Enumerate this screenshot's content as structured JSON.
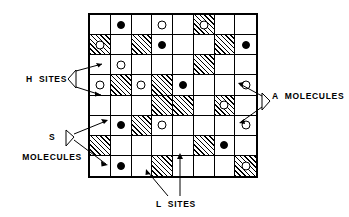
{
  "figure": {
    "type": "lattice-site-diagram",
    "grid": {
      "rows": 8,
      "cols": 8
    },
    "legend_keys": {
      "h_site": "plain (unhatched) square = H site",
      "l_site": "hatched square = L site",
      "a_molecule": "open circle = A molecule",
      "s_molecule": "filled circle = S molecule"
    }
  },
  "labels": {
    "h_sites": "H  SITES",
    "s_molecules_line1": "S",
    "s_molecules_line2": "MOLECULES",
    "a_molecules": "A  MOLECULES",
    "l_sites": "L  SITES"
  },
  "colors": {
    "ink": "#000000",
    "paper": "#ffffff"
  },
  "lattice": {
    "rows": [
      [
        {
          "site": "H",
          "molecule": null
        },
        {
          "site": "H",
          "molecule": "S"
        },
        {
          "site": "H",
          "molecule": null
        },
        {
          "site": "H",
          "molecule": "A"
        },
        {
          "site": "H",
          "molecule": null
        },
        {
          "site": "L",
          "molecule": "A"
        },
        {
          "site": "H",
          "molecule": null
        },
        {
          "site": "H",
          "molecule": null
        }
      ],
      [
        {
          "site": "L",
          "molecule": "A"
        },
        {
          "site": "H",
          "molecule": null
        },
        {
          "site": "L",
          "molecule": null
        },
        {
          "site": "H",
          "molecule": "S"
        },
        {
          "site": "H",
          "molecule": null
        },
        {
          "site": "H",
          "molecule": null
        },
        {
          "site": "L",
          "molecule": null
        },
        {
          "site": "H",
          "molecule": "S"
        }
      ],
      [
        {
          "site": "H",
          "molecule": null
        },
        {
          "site": "H",
          "molecule": "A"
        },
        {
          "site": "H",
          "molecule": null
        },
        {
          "site": "H",
          "molecule": null
        },
        {
          "site": "H",
          "molecule": null
        },
        {
          "site": "L",
          "molecule": null
        },
        {
          "site": "H",
          "molecule": null
        },
        {
          "site": "H",
          "molecule": null
        }
      ],
      [
        {
          "site": "H",
          "molecule": "A"
        },
        {
          "site": "L",
          "molecule": null
        },
        {
          "site": "H",
          "molecule": "A"
        },
        {
          "site": "L",
          "molecule": null
        },
        {
          "site": "H",
          "molecule": "S"
        },
        {
          "site": "H",
          "molecule": null
        },
        {
          "site": "H",
          "molecule": null
        },
        {
          "site": "H",
          "molecule": "A"
        }
      ],
      [
        {
          "site": "H",
          "molecule": null
        },
        {
          "site": "H",
          "molecule": null
        },
        {
          "site": "H",
          "molecule": null
        },
        {
          "site": "L",
          "molecule": null
        },
        {
          "site": "L",
          "molecule": null
        },
        {
          "site": "H",
          "molecule": null
        },
        {
          "site": "L",
          "molecule": "A"
        },
        {
          "site": "H",
          "molecule": null
        }
      ],
      [
        {
          "site": "H",
          "molecule": null
        },
        {
          "site": "H",
          "molecule": "S"
        },
        {
          "site": "L",
          "molecule": null
        },
        {
          "site": "H",
          "molecule": "A"
        },
        {
          "site": "H",
          "molecule": null
        },
        {
          "site": "H",
          "molecule": null
        },
        {
          "site": "H",
          "molecule": null
        },
        {
          "site": "H",
          "molecule": "A"
        }
      ],
      [
        {
          "site": "L",
          "molecule": null
        },
        {
          "site": "H",
          "molecule": null
        },
        {
          "site": "H",
          "molecule": null
        },
        {
          "site": "H",
          "molecule": null
        },
        {
          "site": "H",
          "molecule": null
        },
        {
          "site": "L",
          "molecule": null
        },
        {
          "site": "H",
          "molecule": "S"
        },
        {
          "site": "H",
          "molecule": null
        }
      ],
      [
        {
          "site": "H",
          "molecule": null
        },
        {
          "site": "H",
          "molecule": "S"
        },
        {
          "site": "H",
          "molecule": null
        },
        {
          "site": "L",
          "molecule": null
        },
        {
          "site": "H",
          "molecule": null
        },
        {
          "site": "H",
          "molecule": null
        },
        {
          "site": "H",
          "molecule": null
        },
        {
          "site": "L",
          "molecule": "A"
        }
      ]
    ]
  }
}
